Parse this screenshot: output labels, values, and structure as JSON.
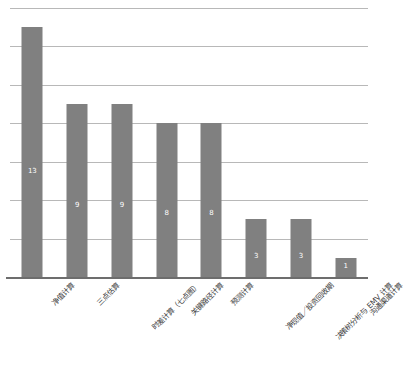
{
  "chart_data": {
    "type": "bar",
    "title": "",
    "subtitle": "",
    "xlabel": "",
    "ylabel": "",
    "ylim": [
      0,
      14
    ],
    "grid": true,
    "gridline_values": [
      0,
      2,
      4,
      6,
      8,
      10,
      12,
      14
    ],
    "legend": false,
    "legend_position": "none",
    "orientation": "vertical",
    "bar_color": "#808080",
    "gridline_color": "#b8b8b8",
    "axis_color": "#6d6d6d",
    "value_label_color": "#ffffff",
    "tick_label_rotation": -45,
    "categories": [
      "净值计算",
      "三点估算",
      "时差计算（七点图）",
      "关键路径计算",
      "预测计算",
      "净现值／投资回收期",
      "决策树分析与 EMV 计算",
      "沟通渠道计算"
    ],
    "values": [
      13,
      9,
      9,
      8,
      8,
      3,
      3,
      1
    ],
    "value_labels": [
      "13",
      "9",
      "9",
      "8",
      "8",
      "3",
      "3",
      "1"
    ],
    "series": [
      {
        "name": "",
        "values": [
          13,
          9,
          9,
          8,
          8,
          3,
          3,
          1
        ]
      }
    ]
  }
}
